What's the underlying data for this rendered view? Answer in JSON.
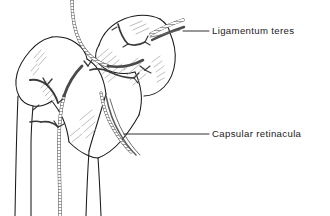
{
  "figure": {
    "kind": "anatomical-line-drawing",
    "background_color": "#ffffff",
    "ink_color": "#1a1a1a",
    "vessel_color": "#4a4a4a",
    "hatch_color": "#8a8a8a",
    "leader_color": "#1a1a1a"
  },
  "labels": [
    {
      "id": "ligamentum-teres",
      "text": "Ligamentum teres",
      "leader": {
        "x1": 183,
        "y1": 31,
        "x2": 209,
        "y2": 31
      }
    },
    {
      "id": "capsular-retinacula",
      "text": "Capsular retinacula",
      "leader": {
        "x1": 124,
        "y1": 134,
        "x2": 209,
        "y2": 134
      }
    }
  ]
}
